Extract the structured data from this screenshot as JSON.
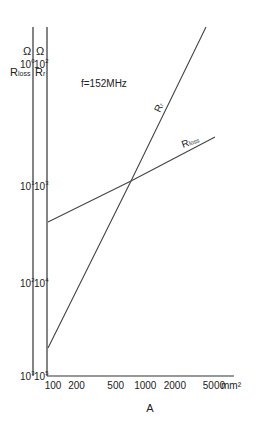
{
  "chart_data": {
    "type": "line",
    "title": "",
    "annotation": "f=152MHz",
    "xlabel": "A",
    "x_unit": "mm²",
    "x_scale": "log",
    "xlim": [
      100,
      8000
    ],
    "x_ticks": [
      {
        "value": 100,
        "label": "100"
      },
      {
        "value": 200,
        "label": "200"
      },
      {
        "value": 500,
        "label": "500"
      },
      {
        "value": 1000,
        "label": "1000"
      },
      {
        "value": 2000,
        "label": "2000"
      },
      {
        "value": 5000,
        "label": "5000"
      }
    ],
    "y_axes": [
      {
        "name": "Rloss",
        "unit": "Ω",
        "label": "Rloss",
        "scale": "log",
        "ylim": [
          0.001,
          1
        ],
        "ticks": [
          {
            "value": 1,
            "base": "10",
            "exp": "0"
          },
          {
            "value": 0.1,
            "base": "10",
            "exp": "-1"
          },
          {
            "value": 0.01,
            "base": "10",
            "exp": "-2"
          },
          {
            "value": 0.001,
            "base": "10",
            "exp": "-3"
          }
        ]
      },
      {
        "name": "Rr",
        "unit": "Ω",
        "label": "Rr",
        "scale": "log",
        "ylim": [
          1e-05,
          0.01
        ],
        "ticks": [
          {
            "value": 0.01,
            "base": "10",
            "exp": "-2"
          },
          {
            "value": 0.001,
            "base": "10",
            "exp": "-3"
          },
          {
            "value": 0.0001,
            "base": "10",
            "exp": "-4"
          },
          {
            "value": 1e-05,
            "base": "10",
            "exp": "-5"
          }
        ]
      }
    ],
    "series": [
      {
        "name": "Rr",
        "label": "Rr",
        "axis": "Rr",
        "points": [
          [
            100,
            2.2e-05
          ],
          [
            800,
            0.001
          ],
          [
            7800,
            0.01
          ]
        ]
      },
      {
        "name": "Rloss",
        "label": "Rloss",
        "axis": "Rloss",
        "points": [
          [
            100,
            0.036
          ],
          [
            800,
            0.1
          ],
          [
            7000,
            0.28
          ]
        ]
      }
    ]
  }
}
